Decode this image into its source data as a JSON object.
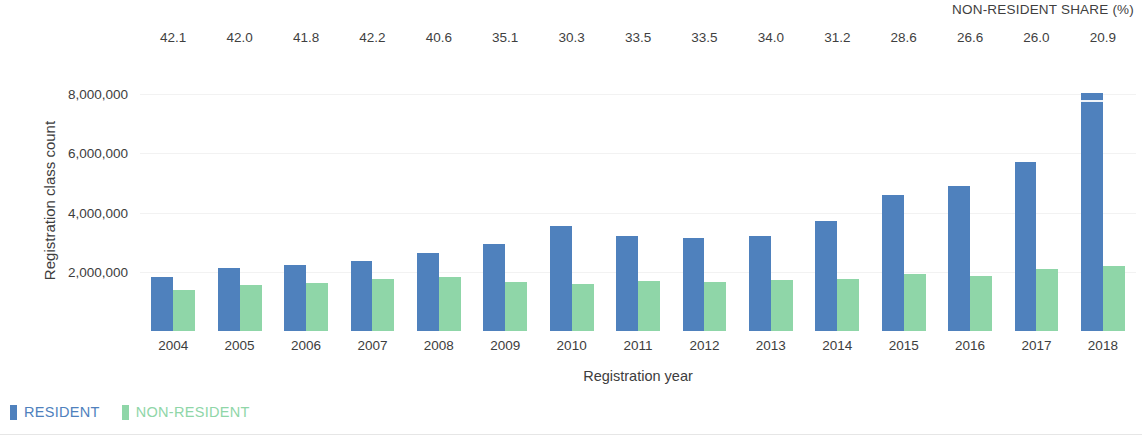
{
  "chart_data": {
    "type": "bar",
    "title": "",
    "xlabel": "Registration year",
    "ylabel": "Registration class count",
    "categories": [
      "2004",
      "2005",
      "2006",
      "2007",
      "2008",
      "2009",
      "2010",
      "2011",
      "2012",
      "2013",
      "2014",
      "2015",
      "2016",
      "2017",
      "2018"
    ],
    "series": [
      {
        "name": "RESIDENT",
        "color": "#4f81bd",
        "values": [
          1820000,
          2120000,
          2230000,
          2370000,
          2620000,
          2950000,
          3560000,
          3200000,
          3130000,
          3200000,
          3700000,
          4600000,
          4880000,
          5700000,
          8050000
        ]
      },
      {
        "name": "NON-RESIDENT",
        "color": "#8fd6a8",
        "values": [
          1380000,
          1560000,
          1620000,
          1760000,
          1820000,
          1660000,
          1600000,
          1680000,
          1650000,
          1720000,
          1760000,
          1920000,
          1860000,
          2080000,
          2200000
        ]
      }
    ],
    "annotation_row": {
      "title": "NON-RESIDENT SHARE (%)",
      "values": [
        "42.1",
        "42.0",
        "41.8",
        "42.2",
        "40.6",
        "35.1",
        "30.3",
        "33.5",
        "33.5",
        "34.0",
        "31.2",
        "28.6",
        "26.6",
        "26.0",
        "20.9"
      ]
    },
    "yticks": [
      {
        "value": 2000000,
        "label": "2,000,000"
      },
      {
        "value": 4000000,
        "label": "4,000,000"
      },
      {
        "value": 6000000,
        "label": "6,000,000"
      },
      {
        "value": 8000000,
        "label": "8,000,000"
      }
    ],
    "ylim": [
      0,
      9150000
    ],
    "grid": true,
    "legend_position": "bottom-left"
  }
}
